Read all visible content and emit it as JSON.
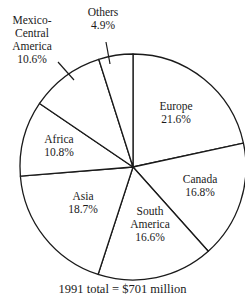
{
  "chart_data": {
    "type": "pie",
    "title": "",
    "caption": "1991 total = $701 million",
    "start_angle_deg_clockwise_from_top": 0,
    "direction": "clockwise",
    "slices": [
      {
        "label": "Europe",
        "value": 21.6,
        "display": "21.6%"
      },
      {
        "label": "Canada",
        "value": 16.8,
        "display": "16.8%"
      },
      {
        "label": "South America",
        "value": 16.6,
        "display": "16.6%"
      },
      {
        "label": "Asia",
        "value": 18.7,
        "display": "18.7%"
      },
      {
        "label": "Africa",
        "value": 10.8,
        "display": "10.8%"
      },
      {
        "label": "Mexico-Central America",
        "value": 10.6,
        "display": "10.6%"
      },
      {
        "label": "Others",
        "value": 4.9,
        "display": "4.9%"
      }
    ],
    "colors": {
      "fill": "#ffffff",
      "stroke": "#1a1a1a"
    },
    "legend": "none (labels inside/outside slices)"
  },
  "labels": {
    "europe": {
      "line1": "Europe",
      "line2": "21.6%"
    },
    "canada": {
      "line1": "Canada",
      "line2": "16.8%"
    },
    "south_america": {
      "line1": "South",
      "line2": "America",
      "line3": "16.6%"
    },
    "asia": {
      "line1": "Asia",
      "line2": "18.7%"
    },
    "africa": {
      "line1": "Africa",
      "line2": "10.8%"
    },
    "mexico": {
      "line1": "Mexico-",
      "line2": "Central",
      "line3": "America",
      "line4": "10.6%"
    },
    "others": {
      "line1": "Others",
      "line2": "4.9%"
    }
  },
  "caption": "1991 total = $701 million"
}
